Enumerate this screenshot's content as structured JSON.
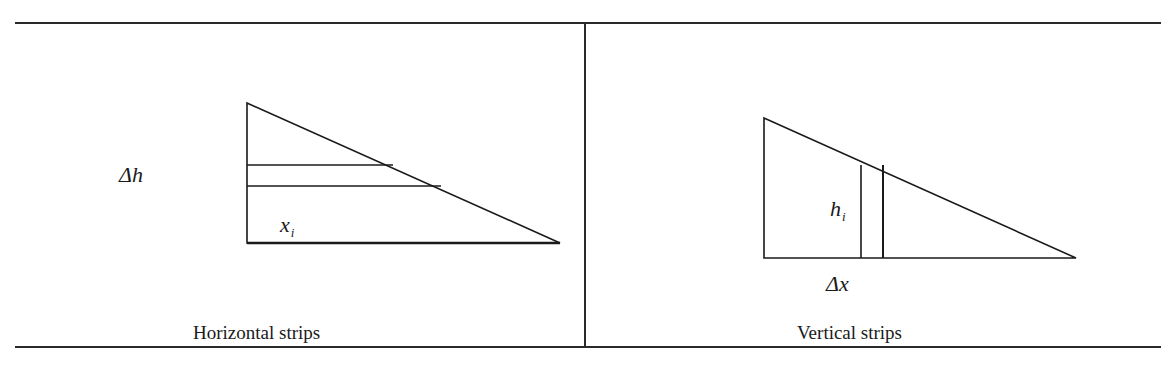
{
  "table": {
    "panels": [
      {
        "id": "horizontal",
        "caption": "Horizontal strips",
        "labels": {
          "delta": "Δh",
          "var_base": "x",
          "var_sub": "i"
        },
        "triangle": {
          "top": [
            247,
            103
          ],
          "bottom_left": [
            247,
            243
          ],
          "right": [
            560,
            243
          ]
        },
        "strips": [
          {
            "x1": 247,
            "y1": 165,
            "x2": 393,
            "y2": 165
          },
          {
            "x1": 247,
            "y1": 186,
            "x2": 441,
            "y2": 186
          }
        ]
      },
      {
        "id": "vertical",
        "caption": "Vertical strips",
        "labels": {
          "var_base": "h",
          "var_sub": "i",
          "delta": "Δx"
        },
        "triangle": {
          "top": [
            764,
            118
          ],
          "bottom_left": [
            764,
            258
          ],
          "right": [
            1076,
            258
          ]
        },
        "strips": [
          {
            "x1": 861,
            "y1": 165,
            "x2": 861,
            "y2": 258
          },
          {
            "x1": 883,
            "y1": 165,
            "x2": 883,
            "y2": 258
          }
        ]
      }
    ]
  },
  "colors": {
    "line": "#1a1a1a",
    "background": "#ffffff"
  }
}
